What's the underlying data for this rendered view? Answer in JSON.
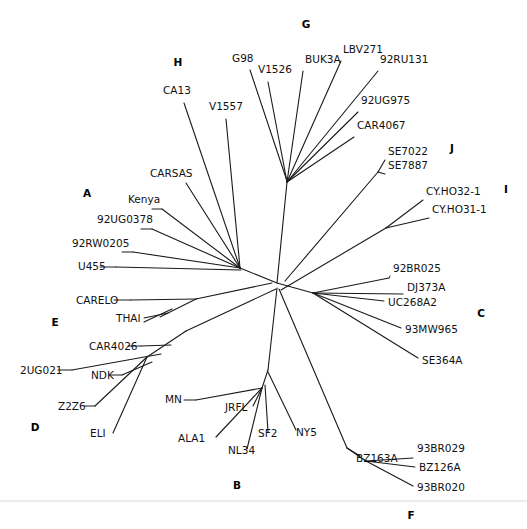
{
  "figure": {
    "type": "phylogenetic-tree",
    "layout": "unrooted-radial",
    "background_color": "#ffffff",
    "line_color": "#1a1a1a",
    "text_color": "#111111",
    "footer_rule_color": "#d8d8d8"
  },
  "clade_labels": [
    {
      "text": "H",
      "x": 178,
      "y": 66
    },
    {
      "text": "G",
      "x": 306,
      "y": 28
    },
    {
      "text": "J",
      "x": 452,
      "y": 152
    },
    {
      "text": "I",
      "x": 506,
      "y": 193
    },
    {
      "text": "A",
      "x": 87,
      "y": 197
    },
    {
      "text": "C",
      "x": 481,
      "y": 317
    },
    {
      "text": "E",
      "x": 55,
      "y": 326
    },
    {
      "text": "D",
      "x": 35,
      "y": 431
    },
    {
      "text": "B",
      "x": 237,
      "y": 489
    },
    {
      "text": "F",
      "x": 411,
      "y": 519
    }
  ],
  "taxa": [
    {
      "name": "CA13",
      "x": 163,
      "y": 94,
      "anchor": "start"
    },
    {
      "name": "V1557",
      "x": 209,
      "y": 110,
      "anchor": "start"
    },
    {
      "name": "G98",
      "x": 232,
      "y": 62,
      "anchor": "start"
    },
    {
      "name": "V1526",
      "x": 258,
      "y": 73,
      "anchor": "start"
    },
    {
      "name": "BUK3A",
      "x": 305,
      "y": 63,
      "anchor": "start"
    },
    {
      "name": "LBV271",
      "x": 343,
      "y": 53,
      "anchor": "start"
    },
    {
      "name": "92RU131",
      "x": 380,
      "y": 63,
      "anchor": "start"
    },
    {
      "name": "92UG975",
      "x": 361,
      "y": 104,
      "anchor": "start"
    },
    {
      "name": "CAR4067",
      "x": 357,
      "y": 129,
      "anchor": "start"
    },
    {
      "name": "SE7022",
      "x": 388,
      "y": 155,
      "anchor": "start"
    },
    {
      "name": "SE7887",
      "x": 388,
      "y": 169,
      "anchor": "start"
    },
    {
      "name": "CY.HO32-1",
      "x": 426,
      "y": 195,
      "anchor": "start"
    },
    {
      "name": "CY.HO31-1",
      "x": 432,
      "y": 213,
      "anchor": "start"
    },
    {
      "name": "CARSAS",
      "x": 150,
      "y": 177,
      "anchor": "start"
    },
    {
      "name": "Kenya",
      "x": 128,
      "y": 203,
      "anchor": "start"
    },
    {
      "name": "92UG0378",
      "x": 97,
      "y": 223,
      "anchor": "start"
    },
    {
      "name": "92RW0205",
      "x": 72,
      "y": 247,
      "anchor": "start"
    },
    {
      "name": "U455",
      "x": 78,
      "y": 270,
      "anchor": "start"
    },
    {
      "name": "CARELO",
      "x": 76,
      "y": 304,
      "anchor": "start"
    },
    {
      "name": "THAI",
      "x": 116,
      "y": 322,
      "anchor": "start"
    },
    {
      "name": "CAR4026",
      "x": 89,
      "y": 350,
      "anchor": "start"
    },
    {
      "name": "2UG021",
      "x": 20,
      "y": 374,
      "anchor": "start"
    },
    {
      "name": "NDK",
      "x": 91,
      "y": 379,
      "anchor": "start"
    },
    {
      "name": "Z2Z6",
      "x": 58,
      "y": 410,
      "anchor": "start"
    },
    {
      "name": "ELI",
      "x": 90,
      "y": 437,
      "anchor": "start"
    },
    {
      "name": "MN",
      "x": 165,
      "y": 403,
      "anchor": "start"
    },
    {
      "name": "JRFL",
      "x": 225,
      "y": 411,
      "anchor": "start"
    },
    {
      "name": "ALA1",
      "x": 178,
      "y": 442,
      "anchor": "start"
    },
    {
      "name": "NL34",
      "x": 228,
      "y": 454,
      "anchor": "start"
    },
    {
      "name": "SF2",
      "x": 258,
      "y": 437,
      "anchor": "start"
    },
    {
      "name": "NY5",
      "x": 296,
      "y": 436,
      "anchor": "start"
    },
    {
      "name": "92BR025",
      "x": 393,
      "y": 272,
      "anchor": "start"
    },
    {
      "name": "DJ373A",
      "x": 407,
      "y": 291,
      "anchor": "start"
    },
    {
      "name": "UC268A2",
      "x": 388,
      "y": 306,
      "anchor": "start"
    },
    {
      "name": "93MW965",
      "x": 405,
      "y": 333,
      "anchor": "start"
    },
    {
      "name": "SE364A",
      "x": 422,
      "y": 364,
      "anchor": "start"
    },
    {
      "name": "BZ163A",
      "x": 356,
      "y": 462,
      "anchor": "start"
    },
    {
      "name": "93BR029",
      "x": 417,
      "y": 452,
      "anchor": "start"
    },
    {
      "name": "BZ126A",
      "x": 419,
      "y": 471,
      "anchor": "start"
    },
    {
      "name": "93BR020",
      "x": 417,
      "y": 491,
      "anchor": "start"
    }
  ],
  "branches": [
    {
      "id": "core-spine",
      "points": [
        [
          240,
          268
        ],
        [
          277,
          283
        ],
        [
          313,
          293
        ]
      ]
    },
    {
      "id": "core-g-stem",
      "points": [
        [
          277,
          283
        ],
        [
          287,
          182
        ]
      ]
    },
    {
      "id": "core-b-stem",
      "points": [
        [
          277,
          288
        ],
        [
          268,
          370
        ]
      ]
    },
    {
      "id": "core-f-stem",
      "points": [
        [
          279,
          289
        ],
        [
          347,
          448
        ]
      ]
    },
    {
      "id": "core-e-stem",
      "points": [
        [
          276,
          289
        ],
        [
          186,
          331
        ]
      ]
    },
    {
      "id": "core-de-stem",
      "points": [
        [
          186,
          331
        ],
        [
          147,
          357
        ]
      ]
    },
    {
      "id": "core-j-stem",
      "points": [
        [
          285,
          281
        ],
        [
          378,
          172
        ]
      ]
    },
    {
      "id": "core-i-stem",
      "points": [
        [
          281,
          290
        ],
        [
          386,
          228
        ]
      ]
    },
    {
      "id": "core-carelo",
      "points": [
        [
          272,
          283
        ],
        [
          196,
          299
        ]
      ]
    },
    {
      "id": "g-buk3a",
      "points": [
        [
          287,
          182
        ],
        [
          303,
          71
        ]
      ]
    },
    {
      "id": "g-lbv271",
      "points": [
        [
          287,
          182
        ],
        [
          341,
          61
        ]
      ]
    },
    {
      "id": "g-92ru131",
      "points": [
        [
          287,
          182
        ],
        [
          378,
          71
        ]
      ]
    },
    {
      "id": "g-92ug975",
      "points": [
        [
          287,
          182
        ],
        [
          358,
          112
        ]
      ]
    },
    {
      "id": "g-car4067",
      "points": [
        [
          287,
          182
        ],
        [
          354,
          137
        ]
      ]
    },
    {
      "id": "g-v1526",
      "points": [
        [
          287,
          182
        ],
        [
          268,
          82
        ]
      ]
    },
    {
      "id": "g-g98",
      "points": [
        [
          287,
          181
        ],
        [
          250,
          70
        ]
      ]
    },
    {
      "id": "j-se7022",
      "points": [
        [
          378,
          172
        ],
        [
          385,
          160
        ]
      ]
    },
    {
      "id": "j-se7887",
      "points": [
        [
          378,
          172
        ],
        [
          385,
          174
        ]
      ]
    },
    {
      "id": "i-cy32",
      "points": [
        [
          386,
          228
        ],
        [
          423,
          200
        ]
      ]
    },
    {
      "id": "i-cy31",
      "points": [
        [
          386,
          228
        ],
        [
          429,
          218
        ]
      ]
    },
    {
      "id": "a-ca13",
      "points": [
        [
          240,
          268
        ],
        [
          184,
          103
        ]
      ]
    },
    {
      "id": "a-v1557",
      "points": [
        [
          240,
          268
        ],
        [
          226,
          119
        ]
      ]
    },
    {
      "id": "a-carsas",
      "points": [
        [
          240,
          268
        ],
        [
          186,
          183
        ]
      ]
    },
    {
      "id": "a-kenya",
      "points": [
        [
          240,
          268
        ],
        [
          162,
          209
        ]
      ]
    },
    {
      "id": "a-92ug0378",
      "points": [
        [
          240,
          268
        ],
        [
          152,
          229
        ]
      ]
    },
    {
      "id": "a-92rw0205",
      "points": [
        [
          240,
          268
        ],
        [
          133,
          252
        ]
      ]
    },
    {
      "id": "a-u455",
      "points": [
        [
          241,
          270
        ],
        [
          116,
          267
        ]
      ]
    },
    {
      "id": "e-carelo",
      "points": [
        [
          196,
          299
        ],
        [
          131,
          300
        ]
      ]
    },
    {
      "id": "e-thai-1",
      "points": [
        [
          168,
          313
        ],
        [
          144,
          318
        ]
      ]
    },
    {
      "id": "e-thai-2",
      "points": [
        [
          172,
          309
        ],
        [
          144,
          322
        ]
      ]
    },
    {
      "id": "e-thai-stem",
      "points": [
        [
          196,
          299
        ],
        [
          160,
          317
        ]
      ]
    },
    {
      "id": "d-car4026",
      "points": [
        [
          171,
          345
        ],
        [
          141,
          346
        ]
      ]
    },
    {
      "id": "d-2ug021",
      "points": [
        [
          161,
          354
        ],
        [
          72,
          370
        ]
      ]
    },
    {
      "id": "d-ndk",
      "points": [
        [
          152,
          362
        ],
        [
          122,
          375
        ]
      ]
    },
    {
      "id": "d-z2z6",
      "points": [
        [
          147,
          357
        ],
        [
          95,
          406
        ]
      ]
    },
    {
      "id": "d-eli",
      "points": [
        [
          147,
          357
        ],
        [
          113,
          433
        ]
      ]
    },
    {
      "id": "b-node",
      "points": [
        [
          268,
          370
        ],
        [
          262,
          388
        ]
      ]
    },
    {
      "id": "b-mn",
      "points": [
        [
          262,
          388
        ],
        [
          196,
          400
        ]
      ]
    },
    {
      "id": "b-jrfl",
      "points": [
        [
          262,
          388
        ],
        [
          253,
          406
        ]
      ]
    },
    {
      "id": "b-ala1",
      "points": [
        [
          262,
          388
        ],
        [
          216,
          437
        ]
      ]
    },
    {
      "id": "b-nl34",
      "points": [
        [
          262,
          388
        ],
        [
          247,
          449
        ]
      ]
    },
    {
      "id": "b-sf2",
      "points": [
        [
          265,
          385
        ],
        [
          268,
          432
        ]
      ]
    },
    {
      "id": "b-ny5",
      "points": [
        [
          268,
          372
        ],
        [
          296,
          430
        ]
      ]
    },
    {
      "id": "c-92br025",
      "points": [
        [
          313,
          293
        ],
        [
          389,
          278
        ]
      ]
    },
    {
      "id": "c-dj373a",
      "points": [
        [
          313,
          293
        ],
        [
          403,
          294
        ]
      ]
    },
    {
      "id": "c-uc268a2",
      "points": [
        [
          313,
          293
        ],
        [
          384,
          301
        ]
      ]
    },
    {
      "id": "c-93mw965",
      "points": [
        [
          313,
          293
        ],
        [
          401,
          328
        ]
      ]
    },
    {
      "id": "c-se364a",
      "points": [
        [
          313,
          293
        ],
        [
          418,
          358
        ]
      ]
    },
    {
      "id": "f-node",
      "points": [
        [
          347,
          448
        ],
        [
          366,
          461
        ]
      ]
    },
    {
      "id": "f-bz163a",
      "points": [
        [
          347,
          448
        ],
        [
          360,
          456
        ]
      ]
    },
    {
      "id": "f-93br029",
      "points": [
        [
          366,
          461
        ],
        [
          413,
          458
        ]
      ]
    },
    {
      "id": "f-bz126a",
      "points": [
        [
          366,
          461
        ],
        [
          415,
          467
        ]
      ]
    },
    {
      "id": "f-93br020",
      "points": [
        [
          366,
          461
        ],
        [
          413,
          486
        ]
      ]
    }
  ],
  "leaders": [
    {
      "id": "lead-u455",
      "points": [
        [
          100,
          267
        ],
        [
          116,
          267
        ]
      ]
    },
    {
      "id": "lead-carelo",
      "points": [
        [
          114,
          300
        ],
        [
          131,
          300
        ]
      ]
    },
    {
      "id": "lead-car4026",
      "points": [
        [
          128,
          346
        ],
        [
          141,
          346
        ]
      ]
    },
    {
      "id": "lead-2ug021",
      "points": [
        [
          58,
          370
        ],
        [
          72,
          370
        ]
      ]
    },
    {
      "id": "lead-ndk",
      "points": [
        [
          110,
          375
        ],
        [
          122,
          375
        ]
      ]
    },
    {
      "id": "lead-kenya",
      "points": [
        [
          152,
          209
        ],
        [
          162,
          209
        ]
      ]
    },
    {
      "id": "lead-92ug0378",
      "points": [
        [
          141,
          229
        ],
        [
          152,
          229
        ]
      ]
    },
    {
      "id": "lead-92rw0205",
      "points": [
        [
          122,
          252
        ],
        [
          133,
          252
        ]
      ]
    },
    {
      "id": "lead-z2z6",
      "points": [
        [
          84,
          406
        ],
        [
          95,
          406
        ]
      ]
    },
    {
      "id": "lead-mn",
      "points": [
        [
          184,
          400
        ],
        [
          196,
          400
        ]
      ]
    },
    {
      "id": "lead-92br025",
      "points": [
        [
          389,
          278
        ],
        [
          390,
          276
        ]
      ]
    }
  ],
  "footer_rule": {
    "y": 501,
    "x1": 0,
    "x2": 527
  }
}
